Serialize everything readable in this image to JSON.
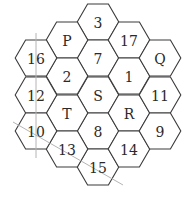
{
  "diagram": {
    "type": "hexagonal-grid",
    "hex_radius": 20.8,
    "cells": [
      {
        "label": "3",
        "cx": 98,
        "cy": 22
      },
      {
        "label": "7",
        "cx": 98,
        "cy": 58
      },
      {
        "label": "S",
        "cx": 98,
        "cy": 95
      },
      {
        "label": "8",
        "cx": 98,
        "cy": 131
      },
      {
        "label": "15",
        "cx": 98,
        "cy": 167
      },
      {
        "label": "P",
        "cx": 67,
        "cy": 40
      },
      {
        "label": "2",
        "cx": 67,
        "cy": 76
      },
      {
        "label": "T",
        "cx": 67,
        "cy": 113
      },
      {
        "label": "13",
        "cx": 67,
        "cy": 149
      },
      {
        "label": "17",
        "cx": 129,
        "cy": 40
      },
      {
        "label": "1",
        "cx": 129,
        "cy": 76
      },
      {
        "label": "R",
        "cx": 129,
        "cy": 113
      },
      {
        "label": "14",
        "cx": 129,
        "cy": 149
      },
      {
        "label": "16",
        "cx": 36,
        "cy": 58
      },
      {
        "label": "12",
        "cx": 36,
        "cy": 95
      },
      {
        "label": "10",
        "cx": 36,
        "cy": 131
      },
      {
        "label": "Q",
        "cx": 160,
        "cy": 58
      },
      {
        "label": "11",
        "cx": 160,
        "cy": 95
      },
      {
        "label": "9",
        "cx": 160,
        "cy": 131
      }
    ],
    "guide_lines": [
      {
        "name": "vertical-line",
        "x1": 36,
        "y1": 33,
        "x2": 36,
        "y2": 158
      },
      {
        "name": "diagonal-line",
        "x1": 13,
        "y1": 122,
        "x2": 123,
        "y2": 185
      }
    ],
    "colors": {
      "hex_stroke": "#3a3a3a",
      "guide": "#b4b4b4",
      "text": "#2a2a2a"
    }
  }
}
